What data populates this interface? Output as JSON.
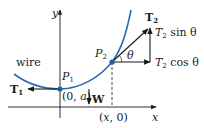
{
  "diagram": {
    "axes": {
      "x_label": "x",
      "y_label": "y"
    },
    "curve_label": "wire",
    "points": {
      "p1": {
        "label": "P",
        "sub": "1",
        "coord_label": "(0, a)"
      },
      "p2": {
        "label": "P",
        "sub": "2",
        "foot_label": "(x, 0)"
      }
    },
    "forces": {
      "t1": {
        "label": "T",
        "sub": "1"
      },
      "w": {
        "label": "W"
      },
      "t2": {
        "label": "T",
        "sub": "2"
      },
      "t2_sin": {
        "label": "T",
        "sub": "2",
        "suffix": " sin θ"
      },
      "t2_cos": {
        "label": "T",
        "sub": "2",
        "suffix": " cos θ"
      }
    },
    "angle_label": "θ",
    "colors": {
      "curve": "#2b6cb0",
      "point": "#1f5fa8",
      "ink": "#1a1a1a"
    }
  }
}
